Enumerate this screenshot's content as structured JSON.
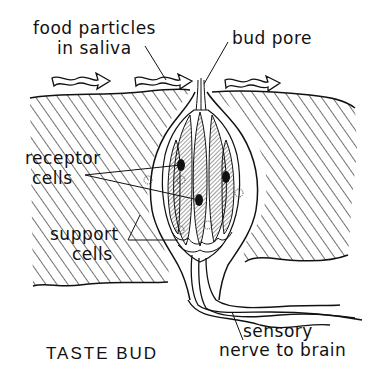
{
  "diagram": {
    "title": "TASTE BUD",
    "labels": {
      "food_line1": "food particles",
      "food_line2": "in saliva",
      "bud_pore": "bud pore",
      "receptor_line1": "receptor",
      "receptor_line2": "cells",
      "support_line1": "support",
      "support_line2": "cells",
      "nerve_line1": "sensory",
      "nerve_line2": "nerve to brain"
    },
    "colors": {
      "ink": "#111111",
      "background": "#ffffff"
    }
  }
}
